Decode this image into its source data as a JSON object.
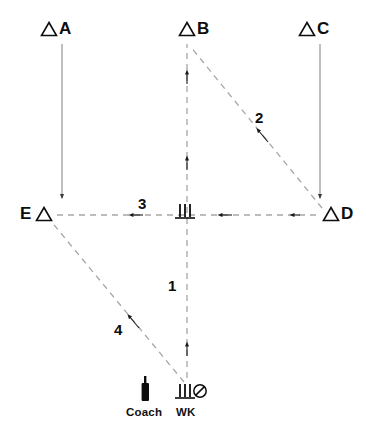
{
  "diagram": {
    "background_color": "#ffffff",
    "ink_color": "#0d0d0d",
    "dash_color": "#9a9a9a",
    "solid_color": "#6f6f6f"
  },
  "cone_markers": [
    {
      "id": "A",
      "label": "A",
      "icon": "triangle-cone-icon",
      "order": "triangle-then-letter",
      "x": 40,
      "y": 20
    },
    {
      "id": "B",
      "label": "B",
      "icon": "triangle-cone-icon",
      "order": "triangle-then-letter",
      "x": 178,
      "y": 20
    },
    {
      "id": "C",
      "label": "C",
      "icon": "triangle-cone-icon",
      "order": "triangle-then-letter",
      "x": 298,
      "y": 20
    },
    {
      "id": "D",
      "label": "D",
      "icon": "triangle-cone-icon",
      "order": "triangle-then-letter",
      "x": 322,
      "y": 207
    },
    {
      "id": "E",
      "label": "E",
      "icon": "triangle-cone-icon",
      "order": "letter-then-triangle",
      "x": 20,
      "y": 207
    }
  ],
  "path_labels": [
    {
      "id": "1",
      "label": "1",
      "x": 168,
      "y": 278
    },
    {
      "id": "2",
      "label": "2",
      "x": 255,
      "y": 110
    },
    {
      "id": "3",
      "label": "3",
      "x": 138,
      "y": 196
    },
    {
      "id": "4",
      "label": "4",
      "x": 114,
      "y": 322
    }
  ],
  "field_icons": [
    {
      "id": "center-wicket",
      "name": "stumps-icon",
      "x": 177,
      "y": 203
    },
    {
      "id": "wk-wicket",
      "name": "stumps-icon",
      "x": 177,
      "y": 383
    },
    {
      "id": "wk-ball",
      "name": "ball-slash-icon",
      "x": 197,
      "y": 385
    },
    {
      "id": "coach-bat",
      "name": "cricket-bat-icon",
      "x": 142,
      "y": 379
    }
  ],
  "foot_labels": [
    {
      "id": "coach",
      "label": "Coach",
      "x": 126,
      "y": 409
    },
    {
      "id": "wk",
      "label": "WK",
      "x": 177,
      "y": 409
    }
  ],
  "movement_paths": [
    {
      "id": "path-a-to-e",
      "style": "solid",
      "from": "A",
      "to": "E",
      "arrow": "end-down"
    },
    {
      "id": "path-c-to-d",
      "style": "solid",
      "from": "C",
      "to": "D",
      "arrow": "end-down"
    },
    {
      "id": "path-1-wk-to-b",
      "style": "dashed",
      "from": "WK",
      "to": "B",
      "arrow": "toward-B",
      "label": "1"
    },
    {
      "id": "path-2-d-to-b",
      "style": "dashed",
      "from": "D",
      "to": "B",
      "arrow": "toward-B",
      "label": "2"
    },
    {
      "id": "path-3-d-to-e",
      "style": "dashed",
      "from": "D",
      "to": "E",
      "arrow": "toward-E",
      "label": "3"
    },
    {
      "id": "path-4-wk-to-e",
      "style": "dashed",
      "from": "WK",
      "to": "E",
      "arrow": "toward-E",
      "label": "4"
    }
  ]
}
